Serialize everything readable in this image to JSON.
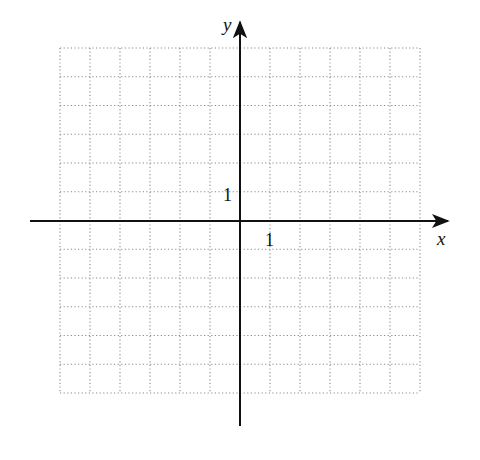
{
  "figure": {
    "type": "coordinate-grid",
    "axes": {
      "x_label": "x",
      "y_label": "y",
      "x_tick_label": "1",
      "y_tick_label": "1"
    },
    "grid": {
      "style": "dotted",
      "columns": 12,
      "rows": 12,
      "x_range": [
        -6,
        6
      ],
      "y_range": [
        -6,
        6
      ]
    },
    "colors": {
      "axis": "#111111",
      "grid": "#8a8a8a",
      "background": "#ffffff"
    }
  },
  "chart_data": {
    "type": "scatter",
    "title": "",
    "xlabel": "x",
    "ylabel": "y",
    "xlim": [
      -6,
      6
    ],
    "ylim": [
      -6,
      6
    ],
    "grid": true,
    "tick_labels": {
      "x": [
        "1"
      ],
      "y": [
        "1"
      ]
    },
    "series": []
  }
}
